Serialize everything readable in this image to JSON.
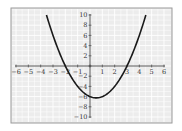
{
  "chart_data": {
    "type": "line",
    "title": "",
    "xlabel": "",
    "ylabel": "",
    "xlim": [
      -6,
      6
    ],
    "ylim": [
      -10,
      10
    ],
    "grid": true,
    "x_ticks": [
      -6,
      -5,
      -4,
      -3,
      -2,
      -1,
      1,
      2,
      3,
      4,
      5,
      6
    ],
    "y_ticks": [
      10,
      8,
      6,
      4,
      2,
      -2,
      -4,
      -6,
      -8,
      -10
    ],
    "series": [
      {
        "name": "y = x^2 - x - 6",
        "function": "x^2 - x - 6",
        "x": [
          -3.53,
          -3,
          -2.5,
          -2,
          -1.5,
          -1,
          -0.5,
          0,
          0.5,
          1,
          1.5,
          2,
          2.5,
          3,
          3.5,
          4,
          4.53
        ],
        "y": [
          10,
          6,
          2.75,
          0,
          -2.25,
          -4,
          -5.25,
          -6,
          -6.25,
          -6,
          -5.25,
          -4,
          -2.25,
          0,
          2.75,
          6,
          10
        ]
      }
    ],
    "annotations": {
      "roots": [
        -2,
        3
      ],
      "vertex": [
        0.5,
        -6.25
      ],
      "y_intercept": -6
    }
  },
  "colors": {
    "background": "#ececec",
    "grid": "#ffffff",
    "frame": "#9a9a9a",
    "axis": "#444444",
    "curve": "#1a1a1a",
    "label": "#333333"
  }
}
